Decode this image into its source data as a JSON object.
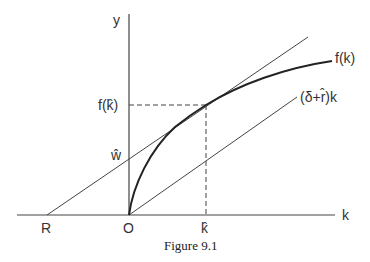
{
  "figure": {
    "caption": "Figure 9.1",
    "axes": {
      "x_label": "k",
      "y_label": "y",
      "origin_label": "O"
    },
    "curves": {
      "production_function": "f(k)",
      "ray_label": "(δ+r̂)k"
    },
    "points": {
      "R_label": "R",
      "k_hat_label": "k̂",
      "f_k_hat_label": "f(k̂)",
      "w_hat_label": "ŵ"
    },
    "colors": {
      "line": "#333333",
      "background": "#ffffff"
    }
  }
}
